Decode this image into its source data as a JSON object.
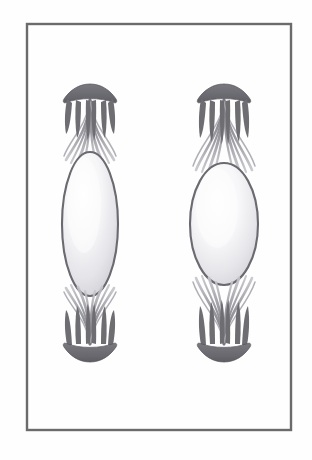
{
  "figure": {
    "title": "Two mitotic spindle apparatus diagrams",
    "caption": "",
    "background_color": "#fefefe",
    "frame": {
      "name": "figure-border",
      "x": 27,
      "y": 24,
      "width": 264,
      "height": 406,
      "stroke_color": "#6b6b6b",
      "stroke_width": 2.4,
      "fill": "none"
    },
    "palette": {
      "pole_dark": "#6e6e72",
      "pole_dark_edge": "#55555a",
      "fiber_gray": "#8a8a90",
      "fiber_light": "#c9c9cf",
      "ellipse_outline": "#6a6a70",
      "ellipse_fill_light": "#ffffff",
      "ellipse_fill_shade": "#dcdce0",
      "ellipse_fill_edge": "#c2c2c8",
      "paper_white": "#fefefe"
    }
  },
  "structures": [
    {
      "id": "spindle-left",
      "label": "Left spindle apparatus",
      "center_x": 90,
      "ellipse": {
        "label": "Left chromatin mass",
        "cx": 90,
        "cy": 224,
        "rx": 28,
        "ry": 72,
        "shape": "narrow-ellipse"
      },
      "top_pole": {
        "label": "Upper spindle pole",
        "cx": 90,
        "cy": 100,
        "half_width": 27,
        "direction": "up"
      },
      "bottom_pole": {
        "label": "Lower spindle pole",
        "cx": 90,
        "cy": 344,
        "half_width": 27,
        "direction": "down"
      },
      "fiber_count_top": 11,
      "fiber_count_bottom": 11
    },
    {
      "id": "spindle-right",
      "label": "Right spindle apparatus",
      "center_x": 224,
      "ellipse": {
        "label": "Right chromatin mass",
        "cx": 224,
        "cy": 224,
        "rx": 34,
        "ry": 61,
        "shape": "broad-ellipse"
      },
      "top_pole": {
        "label": "Upper spindle pole",
        "cx": 224,
        "cy": 100,
        "half_width": 27,
        "direction": "up"
      },
      "bottom_pole": {
        "label": "Lower spindle pole",
        "cx": 224,
        "cy": 344,
        "half_width": 27,
        "direction": "down"
      },
      "fiber_count_top": 11,
      "fiber_count_bottom": 11
    }
  ]
}
